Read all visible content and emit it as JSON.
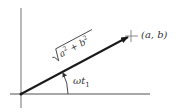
{
  "diagram": {
    "type": "phasor",
    "colors": {
      "axis": "#8a8a8a",
      "vector": "#1a1a1a",
      "text": "#333333",
      "background": "#ffffff"
    },
    "point_label": "(a, b)",
    "magnitude_label": {
      "radicand_a": "a",
      "radicand_op": " + ",
      "radicand_b": "b",
      "exponent": "2"
    },
    "angle_label": {
      "base": "ωt",
      "subscript": "1"
    }
  }
}
